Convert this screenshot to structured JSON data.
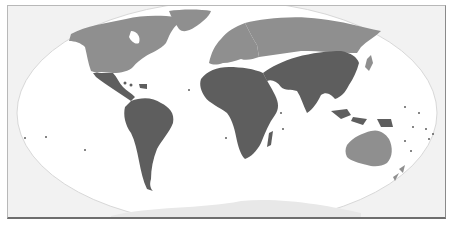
{
  "map": {
    "type": "world-choropleth",
    "projection": "robinson-like",
    "categories": [
      {
        "name": "group-a",
        "color": "#5e5e5e",
        "regions": [
          "Mexico",
          "Central America",
          "Caribbean",
          "South America",
          "Africa",
          "Middle East",
          "Central Asia",
          "South Asia",
          "China",
          "Southeast Asia",
          "Pacific Islands"
        ]
      },
      {
        "name": "group-b",
        "color": "#8f8f8f",
        "regions": [
          "Canada",
          "United States",
          "Greenland",
          "Europe",
          "Russia",
          "Japan",
          "Australia",
          "New Zealand"
        ]
      }
    ],
    "colors": {
      "ocean": "#ffffff",
      "outside": "#f2f2f2",
      "antarctica": "#e9e9e9",
      "frame": "#8a8a8a"
    }
  }
}
